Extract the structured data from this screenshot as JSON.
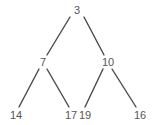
{
  "diagram": {
    "type": "binary-tree",
    "background_color": "#ffffff",
    "node_text_color": "#565656",
    "edge_color": "#4a4a4a",
    "edge_width": 1.4,
    "nodes": [
      {
        "id": "root",
        "label": "3",
        "x": 77,
        "y": 10,
        "level": 0
      },
      {
        "id": "left",
        "label": "7",
        "x": 43,
        "y": 62,
        "level": 1
      },
      {
        "id": "right",
        "label": "10",
        "x": 108,
        "y": 62,
        "level": 1
      },
      {
        "id": "leaf1",
        "label": "14",
        "x": 16,
        "y": 115,
        "level": 2
      },
      {
        "id": "leaf2",
        "label": "17",
        "x": 71,
        "y": 115,
        "level": 2
      },
      {
        "id": "leaf3",
        "label": "19",
        "x": 85,
        "y": 115,
        "level": 2
      },
      {
        "id": "leaf4",
        "label": "16",
        "x": 140,
        "y": 115,
        "level": 2
      }
    ],
    "edges": [
      {
        "from": "root",
        "to": "left",
        "x1": 70,
        "y1": 17,
        "x2": 47,
        "y2": 55
      },
      {
        "from": "root",
        "to": "right",
        "x1": 84,
        "y1": 17,
        "x2": 104,
        "y2": 55
      },
      {
        "from": "left",
        "to": "leaf1",
        "x1": 39,
        "y1": 69,
        "x2": 19,
        "y2": 107
      },
      {
        "from": "left",
        "to": "leaf2",
        "x1": 47,
        "y1": 69,
        "x2": 69,
        "y2": 107
      },
      {
        "from": "right",
        "to": "leaf3",
        "x1": 103,
        "y1": 69,
        "x2": 85,
        "y2": 107
      },
      {
        "from": "right",
        "to": "leaf4",
        "x1": 112,
        "y1": 69,
        "x2": 136,
        "y2": 107
      }
    ]
  }
}
